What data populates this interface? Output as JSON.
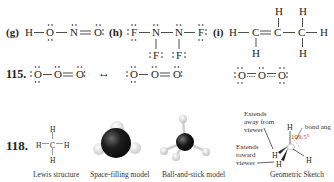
{
  "problem_g": {
    "label": "(g)",
    "atoms": [
      "H",
      "O",
      "N",
      "O"
    ],
    "bonds": [
      "single",
      "single",
      "double"
    ]
  },
  "problem_h": {
    "label": "(h)",
    "atoms": [
      "F",
      "N",
      "N",
      "F",
      "F",
      "F"
    ]
  },
  "problem_i": {
    "label": "(i)",
    "atoms": [
      "H",
      "C",
      "C",
      "C",
      "H",
      "H",
      "H",
      "H",
      "H",
      "H"
    ]
  },
  "problem_115": {
    "number": "115.",
    "arrow": "↔",
    "structure_1": [
      "O",
      "O",
      "O"
    ],
    "structure_2": [
      "O",
      "O",
      "O"
    ],
    "hybrid": [
      "O",
      "O",
      "O"
    ]
  },
  "problem_118": {
    "number": "118.",
    "models": [
      {
        "caption": "Lewis structure"
      },
      {
        "caption": "Space-filling model"
      },
      {
        "caption": "Ball-and-stick model"
      },
      {
        "caption": "Geometric Sketch"
      }
    ],
    "lewis_atoms": {
      "center": "C",
      "h": "H"
    },
    "sketch": {
      "note_away": [
        "Extends",
        "away from",
        "viewer"
      ],
      "note_toward": [
        "Extends",
        "toward",
        "viewer"
      ],
      "note_bond_angle": "bond ang",
      "angle_value": "109.5°",
      "atoms": {
        "center": "C",
        "h": "H"
      }
    }
  },
  "colors": {
    "text": "#231f20",
    "angle": "#c0392b",
    "carbon": "#1a1a1a",
    "hydrogen": "#e6e6e6"
  }
}
